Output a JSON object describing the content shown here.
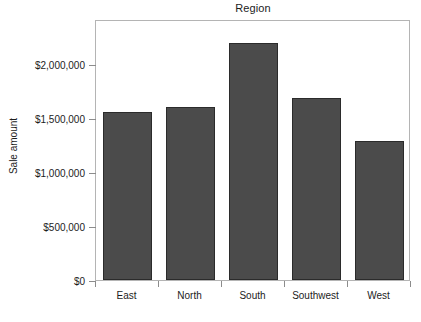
{
  "chart_data": {
    "type": "bar",
    "title": "Region",
    "xlabel": "",
    "ylabel": "Sale amount",
    "categories": [
      "East",
      "North",
      "South",
      "Southwest",
      "West"
    ],
    "values": [
      1560000,
      1600000,
      2200000,
      1690000,
      1290000
    ],
    "ylim": [
      0,
      2420000
    ],
    "ytick_values": [
      0,
      500000,
      1000000,
      1500000,
      2000000
    ],
    "ytick_labels": [
      "$0",
      "$500,000",
      "$1,000,000",
      "$1,500,000",
      "$2,000,000"
    ],
    "grid": false,
    "legend": false,
    "bar_color": "#4b4b4b",
    "bar_edge_color": "#2b2b2b",
    "frame_color": "#b4b4b4",
    "background_color": "#ffffff",
    "text_color": "#1c1c1c"
  }
}
